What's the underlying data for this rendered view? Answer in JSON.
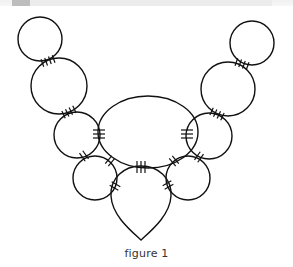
{
  "figure": {
    "caption": "figure 1",
    "stroke_color": "#111111",
    "background": "#ffffff",
    "shapes": {
      "center_ellipse": {
        "cx": 148,
        "cy": 132,
        "rx": 50,
        "ry": 36
      },
      "bottom_teardrop": {
        "top_y": 166,
        "tip": [
          141,
          240
        ],
        "left_x": 111,
        "right_x": 171
      },
      "left_chain": [
        {
          "cx": 40,
          "cy": 39,
          "r": 22
        },
        {
          "cx": 59,
          "cy": 86,
          "r": 28
        },
        {
          "cx": 77,
          "cy": 135,
          "r": 23
        },
        {
          "cx": 95,
          "cy": 178,
          "r": 22
        }
      ],
      "right_chain": [
        {
          "cx": 252,
          "cy": 43,
          "r": 22
        },
        {
          "cx": 228,
          "cy": 89,
          "r": 27
        },
        {
          "cx": 209,
          "cy": 136,
          "r": 23
        },
        {
          "cx": 188,
          "cy": 178,
          "r": 22
        }
      ]
    },
    "seam_marks": {
      "description": "Hatch marks indicate stitched joins between pieces",
      "counts": [
        "4",
        "4",
        "4",
        "4",
        "3",
        "3",
        "3",
        "2",
        "2",
        "2",
        "2",
        "2",
        "2"
      ]
    }
  }
}
